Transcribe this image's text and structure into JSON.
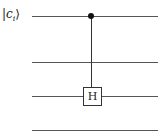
{
  "circuit": {
    "input_label": "|c_i⟩",
    "label_bar": "|",
    "label_var": "c",
    "label_sub": "i",
    "label_ket": "⟩",
    "wires": 4,
    "gate": {
      "label": "H",
      "target_wire": 3,
      "control_wire": 1
    }
  }
}
